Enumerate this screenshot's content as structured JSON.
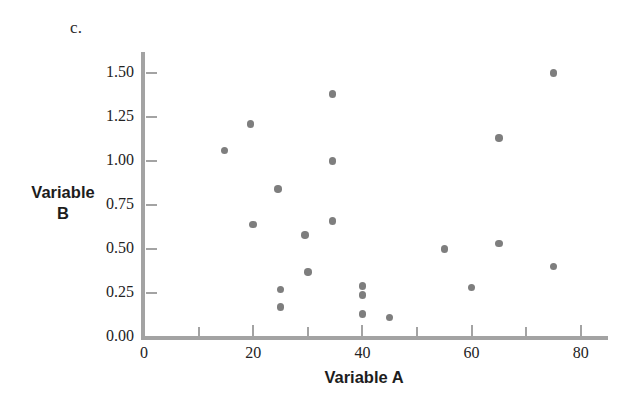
{
  "figure": {
    "panel_label": "c.",
    "y_axis_title_line1": "Variable",
    "y_axis_title_line2": "B",
    "x_axis_title": "Variable A"
  },
  "colors": {
    "point": "#7e7e7e",
    "axis": "#a3a3a3",
    "text": "#232323",
    "background": "#ffffff"
  },
  "chart_data": {
    "type": "scatter",
    "title": "c.",
    "xlabel": "Variable A",
    "ylabel": "Variable B",
    "xlim": [
      0,
      85
    ],
    "ylim": [
      0.0,
      1.6
    ],
    "grid": false,
    "legend": null,
    "xticks": [
      0,
      20,
      40,
      60,
      80
    ],
    "xtick_labels": [
      "0",
      "20",
      "40",
      "60",
      "80"
    ],
    "x_minor_ticks": [
      10,
      30,
      50,
      70
    ],
    "yticks": [
      0.0,
      0.25,
      0.5,
      0.75,
      1.0,
      1.25,
      1.5
    ],
    "ytick_labels": [
      "0.00",
      "0.25",
      "0.50",
      "0.75",
      "1.00",
      "1.25",
      "1.50"
    ],
    "series": [
      {
        "name": "Variable B vs Variable A",
        "marker": "circle",
        "color": "#7e7e7e",
        "points": [
          {
            "x": 14.7,
            "y": 1.06
          },
          {
            "x": 19.5,
            "y": 1.21
          },
          {
            "x": 20.0,
            "y": 0.64
          },
          {
            "x": 24.5,
            "y": 0.84
          },
          {
            "x": 25.0,
            "y": 0.27
          },
          {
            "x": 25.0,
            "y": 0.17
          },
          {
            "x": 29.5,
            "y": 0.58
          },
          {
            "x": 30.0,
            "y": 0.37
          },
          {
            "x": 34.5,
            "y": 1.38
          },
          {
            "x": 34.5,
            "y": 1.0
          },
          {
            "x": 34.5,
            "y": 0.66
          },
          {
            "x": 40.0,
            "y": 0.29
          },
          {
            "x": 40.0,
            "y": 0.24
          },
          {
            "x": 40.0,
            "y": 0.13
          },
          {
            "x": 45.0,
            "y": 0.11
          },
          {
            "x": 55.0,
            "y": 0.5
          },
          {
            "x": 60.0,
            "y": 0.28
          },
          {
            "x": 65.0,
            "y": 1.13
          },
          {
            "x": 65.0,
            "y": 0.53
          },
          {
            "x": 75.0,
            "y": 1.5
          },
          {
            "x": 75.0,
            "y": 0.4
          }
        ]
      }
    ]
  }
}
